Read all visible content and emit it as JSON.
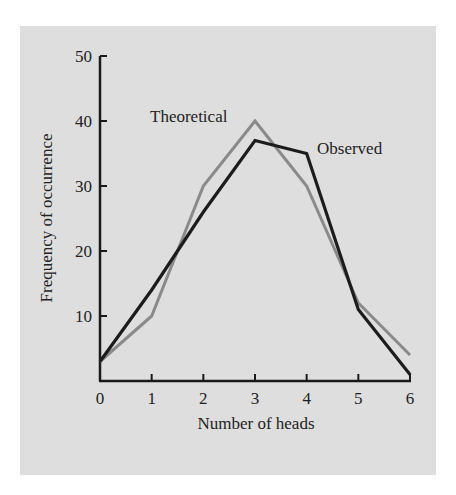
{
  "chart_data": {
    "type": "line",
    "title": "",
    "xlabel": "Number of heads",
    "ylabel": "Frequency of occurrence",
    "x": [
      0,
      1,
      2,
      3,
      4,
      5,
      6
    ],
    "xticks": [
      "0",
      "1",
      "2",
      "3",
      "4",
      "5",
      "6"
    ],
    "yticks": [
      "10",
      "20",
      "30",
      "40",
      "50"
    ],
    "xlim": [
      0,
      6
    ],
    "ylim": [
      0,
      50
    ],
    "grid": false,
    "legend": "inline labels",
    "series": [
      {
        "name": "Theoretical",
        "values": [
          3,
          10,
          30,
          40,
          30,
          12,
          4
        ],
        "color": "#8a8a8a"
      },
      {
        "name": "Observed",
        "values": [
          3,
          14,
          26,
          37,
          35,
          11,
          1
        ],
        "color": "#1c1c1c"
      }
    ],
    "annotations": [
      {
        "text": "Theoretical",
        "series": "Theoretical"
      },
      {
        "text": "Observed",
        "series": "Observed"
      }
    ]
  },
  "colors": {
    "background": "#dedede",
    "axis": "#1a1a1a"
  }
}
